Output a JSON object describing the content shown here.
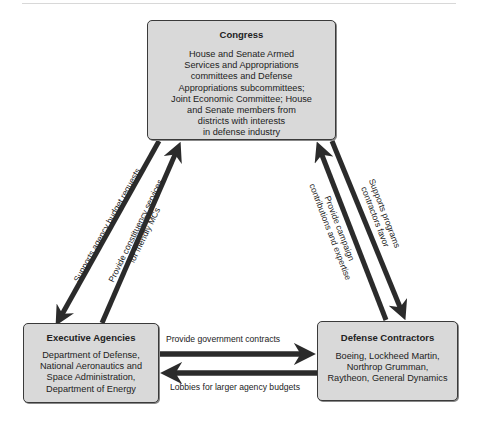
{
  "congress": {
    "title": "Congress",
    "lines": [
      "House and Senate Armed",
      "Services and Appropriations",
      "committees and Defense",
      "Appropriations subcommittees;",
      "Joint Economic Committee; House",
      "and Senate members from",
      "districts with interests",
      "in defense industry"
    ]
  },
  "executive": {
    "title": "Executive Agencies",
    "lines": [
      "Department of Defense,",
      "National Aeronautics and",
      "Space Administration,",
      "Department of Energy"
    ]
  },
  "defense": {
    "title": "Defense Contractors",
    "lines": [
      "Boeing, Lockheed Martin,",
      "Northrop Grumman,",
      "Raytheon, General Dynamics"
    ]
  },
  "arrows": {
    "congress_to_exec": "Supports agency budget requests",
    "exec_to_congress_1": "Provide constituency services",
    "exec_to_congress_2": "for friendly MCs",
    "defense_to_congress_1": "Provide campaign",
    "defense_to_congress_2": "contributions and expertise",
    "congress_to_defense_1": "Supports programs",
    "congress_to_defense_2": "contractors favor",
    "exec_to_defense": "Provide government contracts",
    "defense_to_exec": "Lobbies for larger agency budgets"
  },
  "colors": {
    "box_fill": "#d9d9d9",
    "box_border": "#3a3a3a",
    "arrow": "#2b2b2b"
  }
}
